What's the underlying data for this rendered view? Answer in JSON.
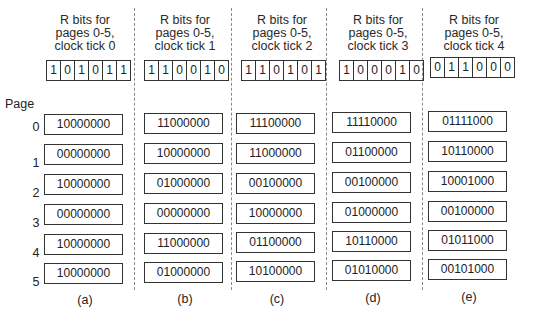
{
  "page_label": "Page",
  "pages": [
    "0",
    "1",
    "2",
    "3",
    "4",
    "5"
  ],
  "columns": [
    {
      "header": [
        "R bits for",
        "pages 0-5,",
        "clock tick 0"
      ],
      "r_bits": [
        "1",
        "0",
        "1",
        "0",
        "1",
        "1"
      ],
      "counters": [
        "10000000",
        "00000000",
        "10000000",
        "00000000",
        "10000000",
        "10000000"
      ],
      "label": "(a)"
    },
    {
      "header": [
        "R bits for",
        "pages 0-5,",
        "clock tick 1"
      ],
      "r_bits": [
        "1",
        "1",
        "0",
        "0",
        "1",
        "0"
      ],
      "counters": [
        "11000000",
        "10000000",
        "01000000",
        "00000000",
        "11000000",
        "01000000"
      ],
      "label": "(b)"
    },
    {
      "header": [
        "R bits for",
        "pages 0-5,",
        "clock tick 2"
      ],
      "r_bits": [
        "1",
        "1",
        "0",
        "1",
        "0",
        "1"
      ],
      "counters": [
        "11100000",
        "11000000",
        "00100000",
        "10000000",
        "01100000",
        "10100000"
      ],
      "label": "(c)"
    },
    {
      "header": [
        "R bits for",
        "pages 0-5,",
        "clock tick 3"
      ],
      "r_bits": [
        "1",
        "0",
        "0",
        "0",
        "1",
        "0"
      ],
      "counters": [
        "11110000",
        "01100000",
        "00100000",
        "01000000",
        "10110000",
        "01010000"
      ],
      "label": "(d)"
    },
    {
      "header": [
        "R bits for",
        "pages 0-5,",
        "clock tick 4"
      ],
      "r_bits": [
        "0",
        "1",
        "1",
        "0",
        "0",
        "0"
      ],
      "counters": [
        "01111000",
        "10110000",
        "10001000",
        "00100000",
        "01011000",
        "00101000"
      ],
      "label": "(e)"
    }
  ]
}
